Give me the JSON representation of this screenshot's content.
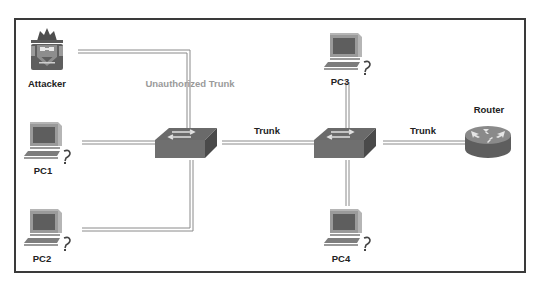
{
  "diagram": {
    "type": "network-topology",
    "colors": {
      "device_dark": "#5a5a5a",
      "device_mid": "#7d7d7d",
      "device_light": "#b5b5b5",
      "link": "#8a8a8a",
      "frame": "#3a3a3a",
      "label": "#222222",
      "unauthorized_label": "#9a9a9a"
    },
    "nodes": [
      {
        "id": "attacker",
        "label": "Attacker",
        "icon": "attacker-icon"
      },
      {
        "id": "pc1",
        "label": "PC1",
        "icon": "computer-icon"
      },
      {
        "id": "pc2",
        "label": "PC2",
        "icon": "computer-icon"
      },
      {
        "id": "switch1",
        "label": "",
        "icon": "switch-icon"
      },
      {
        "id": "switch2",
        "label": "",
        "icon": "switch-icon"
      },
      {
        "id": "pc3",
        "label": "PC3",
        "icon": "computer-icon"
      },
      {
        "id": "pc4",
        "label": "PC4",
        "icon": "computer-icon"
      },
      {
        "id": "router",
        "label": "Router",
        "icon": "router-icon"
      }
    ],
    "links": [
      {
        "from": "attacker",
        "to": "switch1",
        "label": "Unauthorized Trunk"
      },
      {
        "from": "pc1",
        "to": "switch1",
        "label": ""
      },
      {
        "from": "pc2",
        "to": "switch1",
        "label": ""
      },
      {
        "from": "switch1",
        "to": "switch2",
        "label": "Trunk"
      },
      {
        "from": "pc3",
        "to": "switch2",
        "label": ""
      },
      {
        "from": "pc4",
        "to": "switch2",
        "label": ""
      },
      {
        "from": "switch2",
        "to": "router",
        "label": "Trunk"
      }
    ]
  }
}
